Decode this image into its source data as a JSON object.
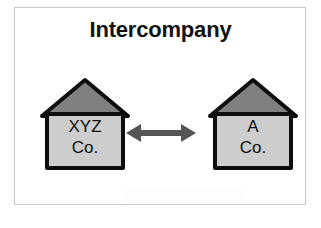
{
  "diagram": {
    "title": "Intercompany",
    "type": "relationship-diagram",
    "background_color": "#ffffff",
    "border_color": "#c9c9c9",
    "entities": [
      {
        "id": "left",
        "shape": "house",
        "label_line1": "XYZ",
        "label_line2": "Co.",
        "roof_color": "#808080",
        "body_color": "#cdcdcd",
        "outline_color": "#0d0d0d"
      },
      {
        "id": "right",
        "shape": "house",
        "label_line1": "A",
        "label_line2": "Co.",
        "roof_color": "#808080",
        "body_color": "#cdcdcd",
        "outline_color": "#0d0d0d"
      }
    ],
    "connector": {
      "kind": "double-headed-arrow",
      "direction": "bidirectional",
      "color": "#555555",
      "from": "XYZ Co.",
      "to": "A Co."
    }
  }
}
